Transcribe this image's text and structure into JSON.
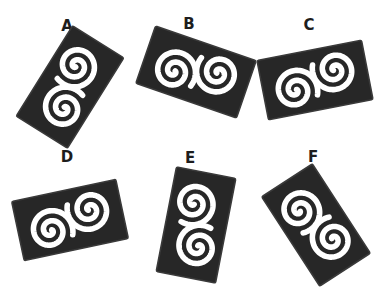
{
  "figure": {
    "background_color": "#ffffff",
    "tile_color": "#272727",
    "tile_edge_color": "#3a3a3a",
    "spiral_color": "#ffffff",
    "label_color": "#1d1d1d",
    "canvas": {
      "width": 384,
      "height": 290
    },
    "tile_size": {
      "width": 108,
      "height": 62
    },
    "spiral_count_per_tile": 2
  },
  "items": [
    {
      "id": "a",
      "label": "A",
      "label_x": 67,
      "label_y": 19,
      "tile_cx": 70,
      "tile_cy": 87,
      "rotation_deg": -58,
      "flipped": false,
      "orientation": "steep-diagonal-up-right"
    },
    {
      "id": "b",
      "label": "B",
      "label_x": 189,
      "label_y": 17,
      "tile_cx": 196,
      "tile_cy": 72,
      "rotation_deg": 19,
      "flipped": false,
      "orientation": "shallow-diagonal-down-right"
    },
    {
      "id": "c",
      "label": "C",
      "label_x": 309,
      "label_y": 18,
      "tile_cx": 315,
      "tile_cy": 80,
      "rotation_deg": -11,
      "flipped": false,
      "orientation": "near-horizontal-up-right"
    },
    {
      "id": "d",
      "label": "D",
      "label_x": 67,
      "label_y": 150,
      "tile_cx": 70,
      "tile_cy": 220,
      "rotation_deg": -12,
      "flipped": false,
      "orientation": "near-horizontal-up-right"
    },
    {
      "id": "e",
      "label": "E",
      "label_x": 190,
      "label_y": 151,
      "tile_cx": 196,
      "tile_cy": 225,
      "rotation_deg": -79,
      "flipped": false,
      "orientation": "near-vertical"
    },
    {
      "id": "f",
      "label": "F",
      "label_x": 313,
      "label_y": 150,
      "tile_cx": 316,
      "tile_cy": 225,
      "rotation_deg": 57,
      "flipped": false,
      "orientation": "steep-diagonal-down-right"
    }
  ]
}
